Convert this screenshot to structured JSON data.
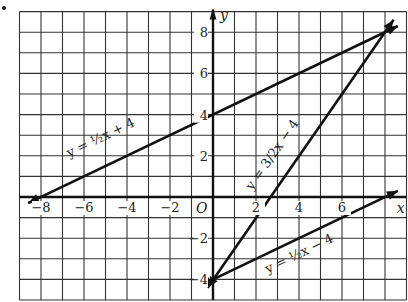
{
  "chart_data": {
    "type": "line",
    "title": "",
    "xlabel": "x",
    "ylabel": "y",
    "origin_label": "O",
    "xlim": [
      -9,
      9
    ],
    "ylim": [
      -5,
      9
    ],
    "grid": true,
    "x_ticks": [
      -8,
      -6,
      -4,
      -2,
      2,
      4,
      6
    ],
    "x_tick_labels": [
      "−8",
      "−6",
      "−4",
      "−2",
      "2",
      "4",
      "6"
    ],
    "y_ticks": [
      8,
      6,
      4,
      2,
      -2,
      -4
    ],
    "y_tick_labels": [
      "8",
      "6",
      "4",
      "2",
      "−2",
      "−4"
    ],
    "series": [
      {
        "name": "y = ½x + 4",
        "label": "y = ½x + 4",
        "slope": 0.5,
        "intercept": 4,
        "x": [
          -8.6,
          8.6
        ],
        "y": [
          -0.3,
          8.3
        ],
        "points": [
          [
            -8,
            0
          ],
          [
            0,
            4
          ],
          [
            8,
            8
          ]
        ]
      },
      {
        "name": "y = 3/2x − 4",
        "label": "y = 3/2x − 4",
        "slope": 1.5,
        "intercept": -4,
        "x": [
          -0.25,
          8.4
        ],
        "y": [
          -4.4,
          8.6
        ],
        "points": [
          [
            0,
            -4
          ],
          [
            8,
            8
          ]
        ]
      },
      {
        "name": "y = ½x − 4",
        "label": "y = ½x − 4",
        "slope": 0.5,
        "intercept": -4,
        "x": [
          -0.6,
          8.6
        ],
        "y": [
          -4.3,
          0.3
        ],
        "points": [
          [
            0,
            -4
          ],
          [
            8,
            0
          ]
        ]
      }
    ],
    "intersections": [
      [
        0,
        -4
      ],
      [
        8,
        8
      ]
    ],
    "legend": "none (labels placed along lines)"
  },
  "labels": {
    "x_axis": "x",
    "y_axis": "y",
    "origin": "O",
    "eq1": "y = ½x + 4",
    "eq2": "y = 3/2x − 4",
    "eq3": "y = ½x − 4"
  }
}
